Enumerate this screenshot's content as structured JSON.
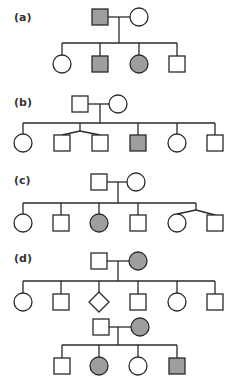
{
  "colors": {
    "affected": "#9e9e9e",
    "unaffected": "#ffffff",
    "stroke": "#2a2a2a",
    "label": "#333333"
  },
  "symbol_legend": {
    "square": "male",
    "circle": "female",
    "diamond": "sex unspecified",
    "filled": "affected",
    "open": "unaffected"
  },
  "panels": [
    {
      "label": "(a)",
      "pedigrees": [
        {
          "parents": [
            {
              "sex": "male",
              "affected": true
            },
            {
              "sex": "female",
              "affected": false
            }
          ],
          "children": [
            {
              "sex": "female",
              "affected": false
            },
            {
              "sex": "male",
              "affected": true
            },
            {
              "sex": "female",
              "affected": true
            },
            {
              "sex": "male",
              "affected": false
            }
          ]
        }
      ]
    },
    {
      "label": "(b)",
      "pedigrees": [
        {
          "parents": [
            {
              "sex": "male",
              "affected": false
            },
            {
              "sex": "female",
              "affected": false
            }
          ],
          "children": [
            {
              "sex": "female",
              "affected": false
            },
            {
              "sex": "male",
              "affected": false,
              "twin_group": 1
            },
            {
              "sex": "male",
              "affected": false,
              "twin_group": 1
            },
            {
              "sex": "male",
              "affected": true
            },
            {
              "sex": "female",
              "affected": false
            },
            {
              "sex": "male",
              "affected": false
            }
          ]
        }
      ]
    },
    {
      "label": "(c)",
      "pedigrees": [
        {
          "parents": [
            {
              "sex": "male",
              "affected": false
            },
            {
              "sex": "female",
              "affected": false
            }
          ],
          "children": [
            {
              "sex": "female",
              "affected": false
            },
            {
              "sex": "male",
              "affected": false
            },
            {
              "sex": "female",
              "affected": true
            },
            {
              "sex": "male",
              "affected": false
            },
            {
              "sex": "female",
              "affected": false,
              "twin_group": 1
            },
            {
              "sex": "male",
              "affected": false,
              "twin_group": 1
            }
          ]
        }
      ]
    },
    {
      "label": "(d)",
      "pedigrees": [
        {
          "parents": [
            {
              "sex": "male",
              "affected": false
            },
            {
              "sex": "female",
              "affected": true
            }
          ],
          "children": [
            {
              "sex": "female",
              "affected": false
            },
            {
              "sex": "male",
              "affected": false
            },
            {
              "sex": "unknown",
              "affected": false
            },
            {
              "sex": "male",
              "affected": false
            },
            {
              "sex": "female",
              "affected": false
            },
            {
              "sex": "male",
              "affected": false
            }
          ]
        },
        {
          "parents": [
            {
              "sex": "male",
              "affected": false
            },
            {
              "sex": "female",
              "affected": true
            }
          ],
          "children": [
            {
              "sex": "male",
              "affected": false
            },
            {
              "sex": "female",
              "affected": true
            },
            {
              "sex": "female",
              "affected": false
            },
            {
              "sex": "male",
              "affected": true
            }
          ]
        }
      ]
    }
  ]
}
